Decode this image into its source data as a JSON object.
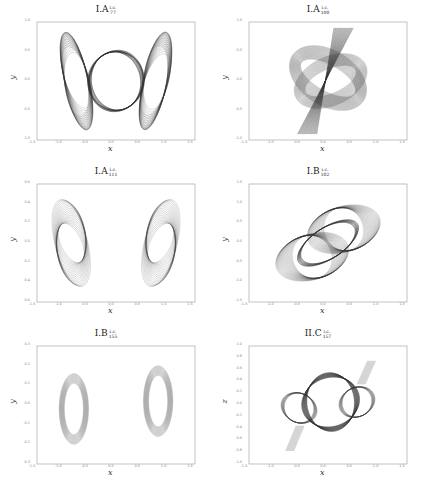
{
  "figure": {
    "layout": "3 rows x 2 columns",
    "line_color": "#333333"
  },
  "chart_data": [
    {
      "id": "p1",
      "type": "line",
      "title": "I.A",
      "title_sup": "i.c.",
      "title_sub": "77",
      "xlabel": "x",
      "ylabel": "y",
      "xlim": [
        -1.5,
        1.5
      ],
      "ylim": [
        -1.0,
        1.0
      ],
      "xticks": [
        "-1.5",
        "-1.0",
        "-0.5",
        "0.0",
        "0.5",
        "1.0",
        "1.5"
      ],
      "yticks": [
        "1.0",
        "0.5",
        "0.0",
        "-0.5",
        "-1.0"
      ],
      "grid": false,
      "description": "Dense family of periodic orbits: central circle of radius ~0.5 with two twisted ribbon lobes extending to x≈±1.0, y≈±0.9",
      "shape": "twin-ribbons-circle"
    },
    {
      "id": "p2",
      "type": "line",
      "title": "I.A",
      "title_sup": "i.c.",
      "title_sub": "100",
      "xlabel": "x",
      "ylabel": "y",
      "xlim": [
        -1.5,
        1.5
      ],
      "ylim": [
        -1.0,
        1.0
      ],
      "xticks": [
        "-1.5",
        "-1.0",
        "-0.5",
        "0.0",
        "0.5",
        "1.0",
        "1.5"
      ],
      "yticks": [
        "1.0",
        "0.5",
        "0.0",
        "-0.5",
        "-1.0"
      ],
      "grid": false,
      "description": "Tilted ring band spanning x∈[-0.9,0.9], y∈[-0.6,0.7] crossed by a dark diagonal bowtie strip from (-0.4,-0.9) to (0.3,0.9)",
      "shape": "ring-bowtie"
    },
    {
      "id": "p3",
      "type": "line",
      "title": "I.A",
      "title_sup": "i.c.",
      "title_sub": "111",
      "xlabel": "x",
      "ylabel": "y",
      "xlim": [
        -1.5,
        1.5
      ],
      "ylim": [
        -0.6,
        0.6
      ],
      "xticks": [
        "-1.5",
        "-1.0",
        "-0.5",
        "0.0",
        "0.5",
        "1.0",
        "1.5"
      ],
      "yticks": [
        "0.6",
        "0.4",
        "0.2",
        "0.0",
        "-0.2",
        "-0.4",
        "-0.6"
      ],
      "grid": false,
      "description": "Central ellipse (x∈[-0.6,0.6], y∈[-0.5,0.5]) with lattice interior and two side lobes reaching x≈±1.1",
      "shape": "ellipse-sidelobes"
    },
    {
      "id": "p4",
      "type": "line",
      "title": "I.B",
      "title_sup": "i.c.",
      "title_sub": "102",
      "xlabel": "x",
      "ylabel": "y",
      "xlim": [
        -1.5,
        1.5
      ],
      "ylim": [
        -1.5,
        1.5
      ],
      "xticks": [
        "-1.5",
        "-1.0",
        "-0.5",
        "0.0",
        "0.5",
        "1.0",
        "1.5"
      ],
      "yticks": [
        "1.5",
        "1.0",
        "0.5",
        "0.0",
        "-0.5",
        "-1.0",
        "-1.5"
      ],
      "grid": false,
      "description": "Two overlapping lattice ellipses tilted at ~45°, spanning from (-1.1,-1.2) to (1.1,1.2)",
      "shape": "double-ellipse-diagonal"
    },
    {
      "id": "p5",
      "type": "line",
      "title": "I.B",
      "title_sup": "i.c.",
      "title_sub": "155",
      "xlabel": "x",
      "ylabel": "y",
      "xlim": [
        -1.5,
        1.5
      ],
      "ylim": [
        -0.3,
        0.3
      ],
      "xticks": [
        "-1.5",
        "-1.0",
        "-0.5",
        "0.0",
        "0.5",
        "1.0",
        "1.5"
      ],
      "yticks": [
        "0.3",
        "0.2",
        "0.1",
        "0.0",
        "-0.1",
        "-0.2",
        "-0.3"
      ],
      "grid": false,
      "description": "Dark central ellipse (x∈[-0.5,0.5], y∈[-0.25,0.25]) with wrapper-like side lobes to x≈±1.1",
      "shape": "candy-wrapper"
    },
    {
      "id": "p6",
      "type": "line",
      "title": "II.C",
      "title_sup": "i.c.",
      "title_sub": "157",
      "xlabel": "x",
      "ylabel": "z",
      "xlim": [
        -1.5,
        1.5
      ],
      "ylim": [
        -1.0,
        1.0
      ],
      "xticks": [
        "-1.5",
        "-1.0",
        "-0.5",
        "0.0",
        "0.5",
        "1.0",
        "1.5"
      ],
      "yticks": [
        "1.0",
        "0.8",
        "0.6",
        "0.4",
        "0.2",
        "0.0",
        "-0.2",
        "-0.4",
        "-0.6",
        "-0.8",
        "-1.0"
      ],
      "grid": false,
      "description": "Knotted ribbon loop: dark central twisted ring with two lighter side loops and tails extending to (0.8,0.8) and (-0.6,-0.8)",
      "shape": "knot-ribbon"
    }
  ]
}
